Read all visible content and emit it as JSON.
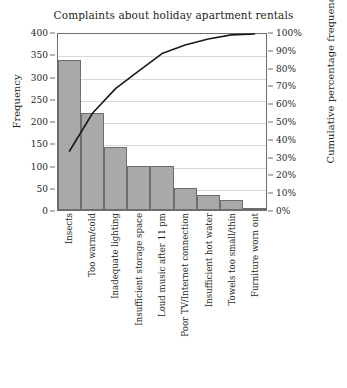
{
  "chart_data": {
    "type": "bar",
    "title": "Complaints about holiday apartment rentals",
    "xlabel": "",
    "ylabel": "Frequency",
    "y2label": "Cumulative percentage frequency",
    "grid": true,
    "legend": "none",
    "ylim": [
      0,
      400
    ],
    "y2lim": [
      0,
      100
    ],
    "yticks": [
      "0",
      "50",
      "100",
      "150",
      "200",
      "250",
      "300",
      "350",
      "400"
    ],
    "ytick_values": [
      0,
      50,
      100,
      150,
      200,
      250,
      300,
      350,
      400
    ],
    "y2ticks": [
      "0%",
      "10%",
      "20%",
      "30%",
      "40%",
      "50%",
      "60%",
      "70%",
      "80%",
      "90%",
      "100%"
    ],
    "y2tick_values": [
      0,
      10,
      20,
      30,
      40,
      50,
      60,
      70,
      80,
      90,
      100
    ],
    "categories": [
      "Insects",
      "Too warm/cold",
      "Inadequate lighting",
      "Insufficient storage space",
      "Loud music after 11 pm",
      "Poor TV/Internet connection",
      "Insufficient hot water",
      "Towels too small/thin",
      "Furniture worn out"
    ],
    "values": [
      338,
      217,
      141,
      100,
      100,
      50,
      34,
      23,
      5
    ],
    "series": [
      {
        "name": "Frequency",
        "type": "bar",
        "axis": "left",
        "values": [
          338,
          217,
          141,
          100,
          100,
          50,
          34,
          23,
          5
        ],
        "color": "#a9a9a9",
        "edge_color": "#6d6d6d"
      },
      {
        "name": "Cumulative percentage frequency",
        "type": "line",
        "axis": "right",
        "values": [
          33.5,
          55.1,
          69.1,
          79.0,
          88.9,
          93.8,
          97.2,
          99.5,
          100.0
        ],
        "color": "#1a1a1a"
      }
    ],
    "total": 1008
  },
  "colors": {
    "bar_fill": "#a9a9a9",
    "bar_edge": "#6d6d6d",
    "line": "#1a1a1a",
    "grid": "#d8d8d8",
    "axis": "#6e6e6e",
    "text": "#231f20",
    "background": "#ffffff"
  }
}
